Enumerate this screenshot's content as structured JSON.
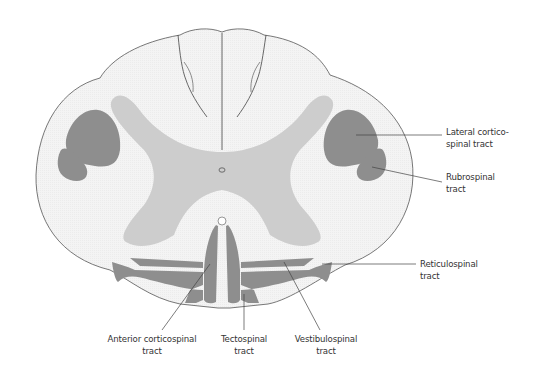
{
  "diagram": {
    "colors": {
      "white_matter": "#f3f3f3",
      "gray_matter": "#cdcdcd",
      "tract_fill": "#8e8e8e",
      "outline": "#555555",
      "leader_line": "#444444",
      "label_text": "#333333"
    },
    "labels": {
      "lateral_corticospinal": {
        "line1": "Lateral cortico-",
        "line2": "spinal tract"
      },
      "rubrospinal": {
        "line1": "Rubrospinal",
        "line2": "tract"
      },
      "reticulospinal": {
        "line1": "Reticulospinal",
        "line2": "tract"
      },
      "anterior_corticospinal": {
        "line1": "Anterior corticospinal",
        "line2": "tract"
      },
      "tectospinal": {
        "line1": "Tectospinal",
        "line2": "tract"
      },
      "vestibulospinal": {
        "line1": "Vestibulospinal",
        "line2": "tract"
      }
    }
  }
}
